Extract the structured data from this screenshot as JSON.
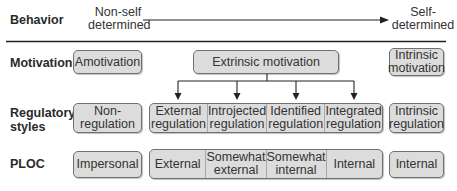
{
  "rows": {
    "behavior": {
      "label": "Behavior",
      "start": "Non-self determined",
      "start_line1": "Non-self",
      "start_line2": "determined",
      "end_line1": "Self-",
      "end_line2": "determined"
    },
    "motivation": {
      "label": "Motivation",
      "amotivation": "Amotivation",
      "extrinsic": "Extrinsic motivation",
      "intrinsic_line1": "Intrinsic",
      "intrinsic_line2": "motivation"
    },
    "regulatory": {
      "label_line1": "Regulatory",
      "label_line2": "styles",
      "non_regulation": [
        "Non-",
        "regulation"
      ],
      "extrinsic_cells": [
        [
          "External",
          "regulation"
        ],
        [
          "Introjected",
          "regulation"
        ],
        [
          "Identified",
          "regulation"
        ],
        [
          "Integrated",
          "regulation"
        ]
      ],
      "intrinsic": [
        "Intrinsic",
        "regulation"
      ]
    },
    "ploc": {
      "label": "PLOC",
      "impersonal": "Impersonal",
      "extrinsic_cells": [
        [
          "External"
        ],
        [
          "Somewhat",
          "external"
        ],
        [
          "Somewhat",
          "internal"
        ],
        [
          "Internal"
        ]
      ],
      "intrinsic": "Internal"
    }
  },
  "colors": {
    "box_fill": "#dcdcdc",
    "box_border": "#707070",
    "line": "#222222"
  }
}
